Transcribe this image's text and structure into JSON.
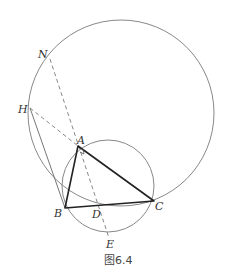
{
  "figure": {
    "caption": "图6.4",
    "points": {
      "A": {
        "label": "A",
        "x": 78,
        "y": 146
      },
      "B": {
        "label": "B",
        "x": 65,
        "y": 208
      },
      "C": {
        "label": "C",
        "x": 154,
        "y": 201
      },
      "D": {
        "label": "D",
        "x": 100,
        "y": 206
      },
      "E": {
        "label": "E",
        "x": 109,
        "y": 238
      },
      "H": {
        "label": "H",
        "x": 30,
        "y": 108
      },
      "N": {
        "label": "N",
        "x": 50,
        "y": 59
      }
    },
    "circles": [
      {
        "name": "large-circle",
        "cx": 121,
        "cy": 113,
        "r": 93
      },
      {
        "name": "circumcircle-ABC",
        "cx": 108,
        "cy": 186,
        "r": 46
      }
    ],
    "colors": {
      "thin_line": "#777777",
      "thick_line": "#222222",
      "dashed": "#888888"
    }
  }
}
